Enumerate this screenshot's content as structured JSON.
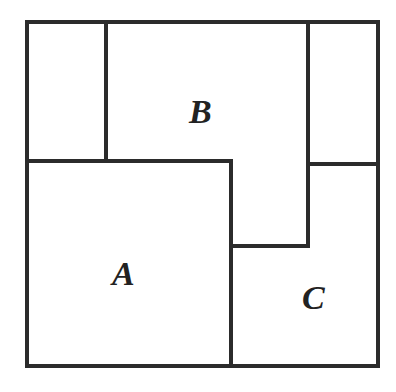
{
  "diagram": {
    "type": "rectangle-partition",
    "line_color": "#2b2b2b",
    "background": "#ffffff",
    "regions": [
      {
        "id": "top-left",
        "label": ""
      },
      {
        "id": "B",
        "label": "B"
      },
      {
        "id": "top-right",
        "label": ""
      },
      {
        "id": "A",
        "label": "A"
      },
      {
        "id": "C",
        "label": "C"
      }
    ],
    "labels": {
      "a": "A",
      "b": "B",
      "c": "C"
    }
  }
}
